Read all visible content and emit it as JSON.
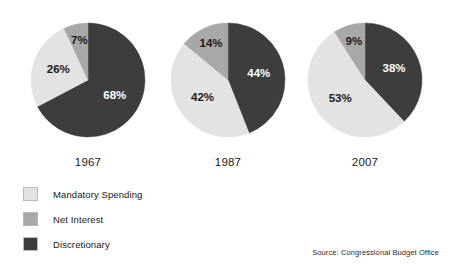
{
  "chart_data": {
    "type": "pie",
    "title": "",
    "subtitle": "",
    "xlabel": "",
    "ylabel": "",
    "legend_position": "bottom-left",
    "grid": false,
    "value_suffix": "%",
    "start_angle_deg": 0,
    "direction": "clockwise",
    "categories": [
      "Discretionary",
      "Mandatory Spending",
      "Net Interest"
    ],
    "category_colors": [
      "#3d3d3d",
      "#e3e3e3",
      "#a8a8a8"
    ],
    "charts": [
      {
        "label": "1967",
        "slices": [
          {
            "category": "Discretionary",
            "value": 68,
            "display": "68%",
            "color": "#3d3d3d",
            "label_on": "dark"
          },
          {
            "category": "Mandatory Spending",
            "value": 26,
            "display": "26%",
            "color": "#e3e3e3",
            "label_on": "light"
          },
          {
            "category": "Net Interest",
            "value": 7,
            "display": "7%",
            "color": "#a8a8a8",
            "label_on": "light"
          }
        ]
      },
      {
        "label": "1987",
        "slices": [
          {
            "category": "Discretionary",
            "value": 44,
            "display": "44%",
            "color": "#3d3d3d",
            "label_on": "dark"
          },
          {
            "category": "Mandatory Spending",
            "value": 42,
            "display": "42%",
            "color": "#e3e3e3",
            "label_on": "light"
          },
          {
            "category": "Net Interest",
            "value": 14,
            "display": "14%",
            "color": "#a8a8a8",
            "label_on": "light"
          }
        ]
      },
      {
        "label": "2007",
        "slices": [
          {
            "category": "Discretionary",
            "value": 38,
            "display": "38%",
            "color": "#3d3d3d",
            "label_on": "dark"
          },
          {
            "category": "Mandatory Spending",
            "value": 53,
            "display": "53%",
            "color": "#e3e3e3",
            "label_on": "light"
          },
          {
            "category": "Net Interest",
            "value": 9,
            "display": "9%",
            "color": "#a8a8a8",
            "label_on": "light"
          }
        ]
      }
    ],
    "legend": [
      {
        "label": "Mandatory Spending",
        "color": "#e3e3e3"
      },
      {
        "label": "Net Interest",
        "color": "#a8a8a8"
      },
      {
        "label": "Discretionary",
        "color": "#3d3d3d"
      }
    ],
    "source": "Source: Congressional Budget Office"
  }
}
